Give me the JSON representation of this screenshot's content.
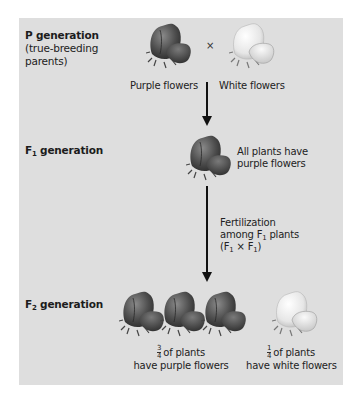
{
  "diagram": {
    "colors": {
      "panel_bg": "#dedede",
      "purple_flower_dark": "#3d3d3d",
      "purple_flower_mid": "#6a6a6a",
      "white_flower": "#f2f2f2",
      "arrow": "#111111"
    },
    "p_generation": {
      "label": "P generation",
      "sublabel_line1": "(true-breeding",
      "sublabel_line2": "parents)",
      "left_caption": "Purple flowers",
      "right_caption": "White flowers",
      "cross_symbol": "×"
    },
    "f1_generation": {
      "label_prefix": "F",
      "label_sub": "1",
      "label_suffix": " generation",
      "caption_line1": "All plants have",
      "caption_line2": "purple flowers"
    },
    "fertilization": {
      "line1": "Fertilization",
      "line2_prefix": "among F",
      "line2_sub": "1",
      "line2_suffix": " plants",
      "line3_open": "(F",
      "line3_sub1": "1",
      "line3_mid": " × F",
      "line3_sub2": "1",
      "line3_close": ")"
    },
    "f2_generation": {
      "label_prefix": "F",
      "label_sub": "2",
      "label_suffix": " generation",
      "purple": {
        "frac_num": "3",
        "frac_den": "4",
        "line1_suffix": "of plants",
        "line2": "have purple flowers",
        "count": 3
      },
      "white": {
        "frac_num": "1",
        "frac_den": "4",
        "line1_suffix": "of plants",
        "line2": "have white flowers",
        "count": 1
      }
    }
  }
}
